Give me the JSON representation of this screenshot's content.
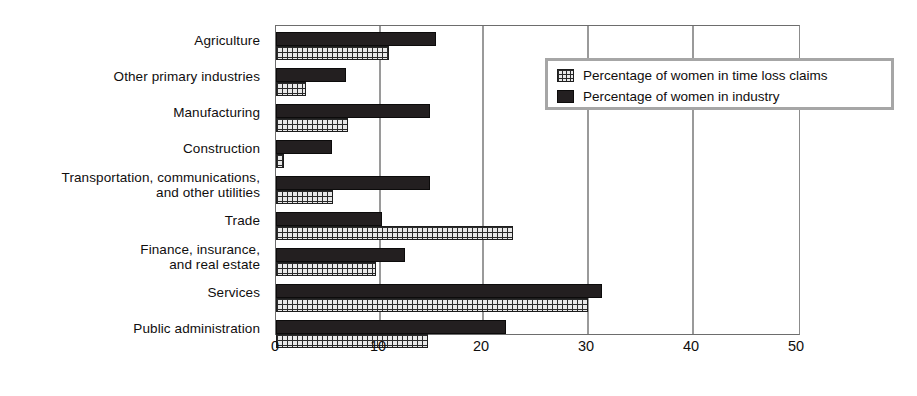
{
  "chart_data": {
    "type": "bar",
    "orientation": "horizontal",
    "title": "",
    "xlabel": "",
    "ylabel": "",
    "xlim": [
      0,
      50
    ],
    "xticks": [
      0,
      10,
      20,
      30,
      40,
      50
    ],
    "grid": true,
    "legend_position": "top-right",
    "categories": [
      "Agriculture",
      "Other primary industries",
      "Manufacturing",
      "Construction",
      "Transportation, communications,\nand other utilities",
      "Trade",
      "Finance, insurance,\nand real estate",
      "Services",
      "Public administration"
    ],
    "series": [
      {
        "name": "Percentage of women in time loss claims",
        "pattern": "cross-hatch",
        "color": "#e8e8e8",
        "values": [
          10.8,
          2.9,
          6.9,
          0.8,
          5.4,
          22.6,
          9.5,
          29.7,
          14.5
        ]
      },
      {
        "name": "Percentage of women in industry",
        "pattern": "solid",
        "color": "#231f20",
        "values": [
          15.2,
          6.7,
          14.7,
          5.3,
          14.7,
          10.1,
          12.3,
          31.0,
          21.9
        ]
      }
    ]
  },
  "legend": {
    "items": [
      {
        "label": "Percentage of women in time loss claims",
        "swatch": "hatch-swatch"
      },
      {
        "label": "Percentage of women in industry",
        "swatch": "dark-swatch"
      }
    ]
  }
}
